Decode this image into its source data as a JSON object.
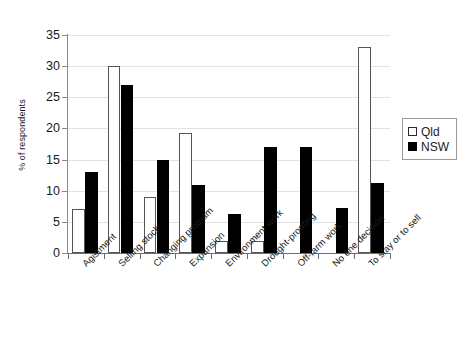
{
  "chart_data": {
    "type": "bar",
    "title": "",
    "xlabel": "",
    "ylabel": "% of respondents",
    "ylim": [
      0,
      35
    ],
    "yticks": [
      0,
      5,
      10,
      15,
      20,
      25,
      30,
      35
    ],
    "grid": true,
    "legend_position": "right",
    "categories": [
      "Agistment",
      "Selling stock",
      "Changing program",
      "Expansion",
      "Environment work",
      "Drought-proofing",
      "Off-farm work",
      "No one decision",
      "To stay or to sell"
    ],
    "series": [
      {
        "name": "Qld",
        "color": "#ffffff",
        "swatch": "open",
        "values": [
          7,
          30,
          9,
          19.3,
          2,
          2,
          0,
          0,
          33
        ]
      },
      {
        "name": "NSW",
        "color": "#000000",
        "swatch": "filled",
        "values": [
          13,
          27,
          15,
          11,
          6.3,
          17,
          17,
          7.3,
          11.2
        ]
      }
    ]
  },
  "axis": {
    "tick_labels": [
      "0",
      "5",
      "10",
      "15",
      "20",
      "25",
      "30",
      "35"
    ]
  },
  "legend": {
    "items": [
      {
        "label": "Qld"
      },
      {
        "label": "NSW"
      }
    ]
  }
}
